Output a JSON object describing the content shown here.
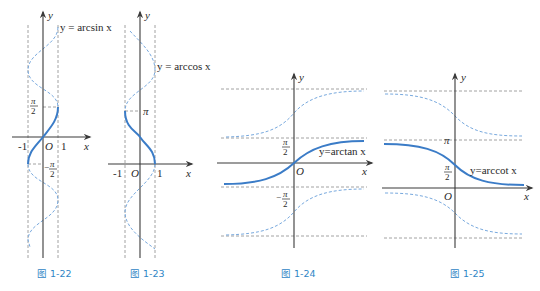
{
  "figures": [
    {
      "id": "fig-1-22",
      "caption": "图 1-22",
      "function_label": "y = arcsin x",
      "axis_x": "x",
      "axis_y": "y",
      "origin": "O",
      "ticks_x": [
        "-1",
        "1"
      ],
      "ticks_y": [
        "π/2",
        "-π/2"
      ],
      "pi_sym": "π",
      "two": "2",
      "minus": "−"
    },
    {
      "id": "fig-1-23",
      "caption": "图 1-23",
      "function_label": "y = arccos x",
      "axis_x": "x",
      "axis_y": "y",
      "origin": "O",
      "ticks_x": [
        "-1",
        "1"
      ],
      "ticks_y": [
        "π"
      ]
    },
    {
      "id": "fig-1-24",
      "caption": "图 1-24",
      "function_label": "y=arctan x",
      "axis_x": "x",
      "axis_y": "y",
      "origin": "O",
      "ticks_y": [
        "π/2",
        "-π/2"
      ]
    },
    {
      "id": "fig-1-25",
      "caption": "图 1-25",
      "function_label": "y=arccot x",
      "axis_x": "x",
      "axis_y": "y",
      "origin": "O",
      "ticks_y": [
        "π",
        "π/2"
      ]
    }
  ],
  "colors": {
    "main_curve": "#3b7cc7",
    "dashed_curve": "#78a9de",
    "guide_lines": "#8a8a8a",
    "axes": "#3a3a3a",
    "caption": "#2f86c6"
  }
}
